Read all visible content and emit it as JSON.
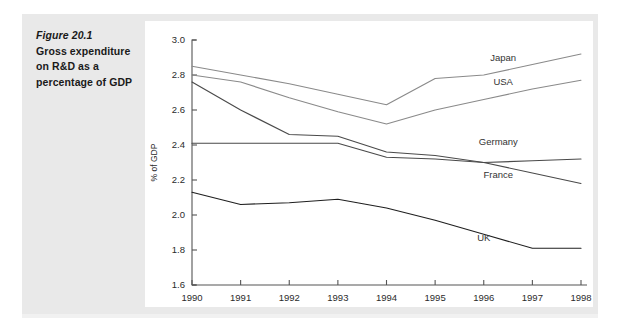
{
  "caption": {
    "figure_number": "Figure 20.1",
    "text": "Gross expenditure on R&D as a percentage of GDP"
  },
  "chart_data": {
    "type": "line",
    "title": "Gross expenditure on R&D as a percentage of GDP",
    "xlabel": "",
    "ylabel": "% of GDP",
    "categories": [
      "1990",
      "1991",
      "1992",
      "1993",
      "1994",
      "1995",
      "1996",
      "1997",
      "1998"
    ],
    "x": [
      1990,
      1991,
      1992,
      1993,
      1994,
      1995,
      1996,
      1997,
      1998
    ],
    "ylim": [
      1.6,
      3.0
    ],
    "yticks": [
      "1.6",
      "1.8",
      "2.0",
      "2.2",
      "2.4",
      "2.6",
      "2.8",
      "3.0"
    ],
    "ytick_values": [
      1.6,
      1.8,
      2.0,
      2.2,
      2.4,
      2.6,
      2.8,
      3.0
    ],
    "grid": false,
    "legend_position": "right-inline-labels",
    "series": [
      {
        "name": "Japan",
        "color": "#8a8a8a",
        "values": [
          2.85,
          2.8,
          2.75,
          2.69,
          2.63,
          2.78,
          2.8,
          2.86,
          2.92
        ],
        "label_x": 1996.4,
        "label_y": 2.9
      },
      {
        "name": "USA",
        "color": "#8a8a8a",
        "values": [
          2.8,
          2.76,
          2.67,
          2.59,
          2.52,
          2.6,
          2.66,
          2.72,
          2.77
        ],
        "label_x": 1996.4,
        "label_y": 2.76
      },
      {
        "name": "Germany",
        "color": "#4a4a4a",
        "values": [
          2.41,
          2.41,
          2.41,
          2.41,
          2.33,
          2.32,
          2.3,
          2.31,
          2.32
        ],
        "label_x": 1996.3,
        "label_y": 2.42
      },
      {
        "name": "France",
        "color": "#4a4a4a",
        "values": [
          2.76,
          2.6,
          2.46,
          2.45,
          2.36,
          2.34,
          2.3,
          2.24,
          2.18
        ],
        "label_x": 1996.3,
        "label_y": 2.23
      },
      {
        "name": "UK",
        "color": "#1f1f1f",
        "values": [
          2.13,
          2.06,
          2.07,
          2.09,
          2.04,
          1.97,
          1.89,
          1.81,
          1.81
        ],
        "label_x": 1996.0,
        "label_y": 1.87
      }
    ]
  }
}
